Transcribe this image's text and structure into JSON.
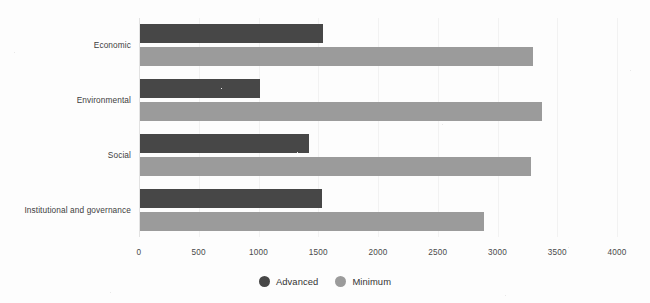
{
  "chart_data": {
    "type": "bar",
    "orientation": "horizontal",
    "title": "",
    "xlabel": "",
    "ylabel": "",
    "categories": [
      "Economic",
      "Environmental",
      "Social",
      "Institutional and governance"
    ],
    "series": [
      {
        "name": "Advanced",
        "color": "#474747",
        "values": [
          1540,
          1010,
          1420,
          1530
        ]
      },
      {
        "name": "Minimum",
        "color": "#9b9b9b",
        "values": [
          3300,
          3370,
          3280,
          2890
        ]
      }
    ],
    "xlim": [
      0,
      4000
    ],
    "xticks": [
      0,
      500,
      1000,
      1500,
      2000,
      2500,
      3000,
      3500,
      4000
    ],
    "xtick_labels": [
      "0",
      "500",
      "1000",
      "1500",
      "2000",
      "2500",
      "3000",
      "3500",
      "4000"
    ],
    "grid": true,
    "grid_axis": "x",
    "legend_position": "bottom-center"
  },
  "legend": {
    "items": [
      {
        "label": "Advanced",
        "color": "#474747",
        "icon": "circle-swatch-icon"
      },
      {
        "label": "Minimum",
        "color": "#9b9b9b",
        "icon": "circle-swatch-icon"
      }
    ]
  },
  "colors": {
    "advanced": "#474747",
    "minimum": "#9b9b9b",
    "gridline": "#f2f2f2",
    "axis": "#e2e2e2",
    "text": "#3d3d3d",
    "background": "#fdfdfd"
  }
}
